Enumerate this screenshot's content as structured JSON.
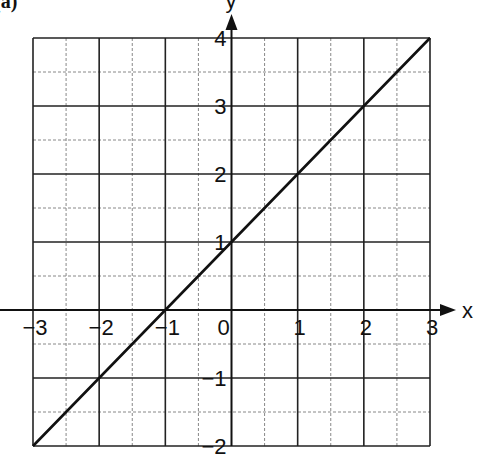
{
  "part_label": "(a)",
  "chart_data": {
    "type": "line",
    "title": "",
    "xlabel": "x",
    "ylabel": "y",
    "xlim": [
      -3,
      3
    ],
    "ylim": [
      -2,
      4
    ],
    "x_ticks": [
      -3,
      -2,
      -1,
      0,
      1,
      2,
      3
    ],
    "y_ticks": [
      -2,
      -1,
      1,
      2,
      3,
      4
    ],
    "x_tick_labels": [
      "−3",
      "−2",
      "−1",
      "0",
      "1",
      "2",
      "3"
    ],
    "y_tick_labels": [
      "−2",
      "−1",
      "1",
      "2",
      "3",
      "4"
    ],
    "grid": true,
    "minor_grid": true,
    "minor_step": 0.5,
    "series": [
      {
        "name": "y = x + 1",
        "x": [
          -3,
          -2,
          -1,
          0,
          1,
          2,
          3
        ],
        "y": [
          -2,
          -1,
          0,
          1,
          2,
          3,
          4
        ]
      }
    ],
    "legend": null
  }
}
